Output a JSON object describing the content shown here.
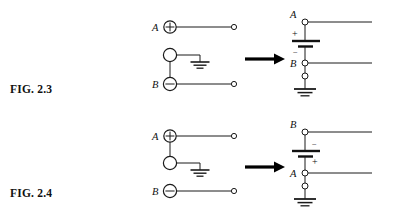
{
  "page": {
    "background_color": "#ffffff",
    "ink_color": "#1a1a1a",
    "width": 396,
    "height": 224
  },
  "figures": [
    {
      "id": "fig-2-3",
      "caption": "FIG. 2.3",
      "source_circuit": {
        "name": "three-terminal-source-grounded-low",
        "terminals": [
          {
            "label": "A",
            "polarity": "+",
            "polarity_glyph": "⊕",
            "row": "top"
          },
          {
            "label": "",
            "polarity": "none",
            "polarity_glyph": "",
            "row": "middle"
          },
          {
            "label": "B",
            "polarity": "−",
            "polarity_glyph": "⊖",
            "row": "bottom"
          }
        ],
        "ground_symbol": "earth-ground",
        "ground_attached_to": "middle",
        "output_terminals": 2
      },
      "transform_arrow": {
        "direction": "right",
        "symbol": "⟶"
      },
      "equivalent_circuit": {
        "name": "battery-equivalent",
        "top_node_label": "A",
        "bottom_node_label": "B",
        "battery_plus_at": "top",
        "plus_glyph": "+",
        "minus_glyph": "−",
        "ground_symbol": "earth-ground",
        "ground_attached_to": "B"
      }
    },
    {
      "id": "fig-2-4",
      "caption": "FIG. 2.4",
      "source_circuit": {
        "name": "three-terminal-source-grounded-high",
        "terminals": [
          {
            "label": "A",
            "polarity": "+",
            "polarity_glyph": "⊕",
            "row": "top"
          },
          {
            "label": "",
            "polarity": "none",
            "polarity_glyph": "",
            "row": "middle"
          },
          {
            "label": "B",
            "polarity": "−",
            "polarity_glyph": "⊖",
            "row": "bottom"
          }
        ],
        "ground_symbol": "earth-ground",
        "ground_attached_to": "middle",
        "output_terminals": 2
      },
      "transform_arrow": {
        "direction": "right",
        "symbol": "⟶"
      },
      "equivalent_circuit": {
        "name": "battery-equivalent-reversed",
        "top_node_label": "B",
        "bottom_node_label": "A",
        "battery_plus_at": "bottom",
        "plus_glyph": "+",
        "minus_glyph": "−",
        "ground_symbol": "earth-ground",
        "ground_attached_to": "A"
      }
    }
  ]
}
